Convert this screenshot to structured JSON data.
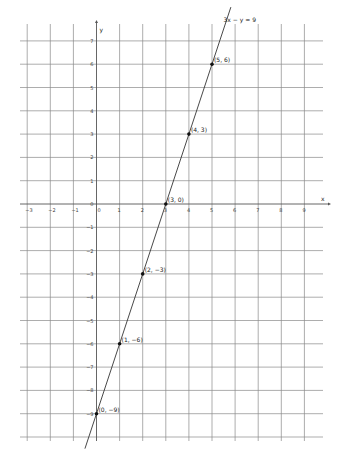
{
  "chart_data": {
    "type": "line",
    "title": "",
    "xlabel": "x",
    "ylabel": "y",
    "xlim": [
      -3,
      9
    ],
    "ylim": [
      -10,
      7
    ],
    "grid": true,
    "x_ticks": [
      -3,
      -2,
      -1,
      0,
      1,
      2,
      3,
      4,
      5,
      6,
      7,
      8,
      9
    ],
    "y_ticks": [
      7,
      6,
      5,
      4,
      3,
      2,
      1,
      0,
      -1,
      -2,
      -3,
      -4,
      -5,
      -6,
      -7,
      -8,
      -9
    ],
    "series": [
      {
        "name": "3x − y = 9",
        "equation": "y = 3x - 9",
        "color": "#333333",
        "points": [
          {
            "x": 0,
            "y": -9,
            "label": "(0, −9)"
          },
          {
            "x": 1,
            "y": -6,
            "label": "(1, −6)"
          },
          {
            "x": 2,
            "y": -3,
            "label": "(2, −3)"
          },
          {
            "x": 3,
            "y": 0,
            "label": "(3, 0)"
          },
          {
            "x": 4,
            "y": 3,
            "label": "(4, 3)"
          },
          {
            "x": 5,
            "y": 6,
            "label": "(5, 6)"
          }
        ]
      }
    ],
    "annotations": [
      {
        "text": "3x − y = 9",
        "x": 5.5,
        "y": 7.8
      }
    ]
  }
}
